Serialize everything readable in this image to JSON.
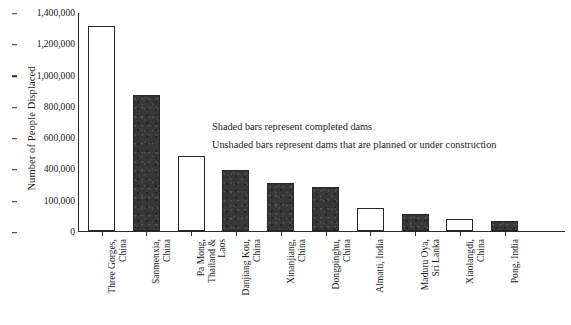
{
  "chart_data": {
    "type": "bar",
    "title": "",
    "xlabel": "",
    "ylabel": "Number of People Displaced",
    "ylim": [
      0,
      1400000
    ],
    "grid": false,
    "legend_position": "none",
    "ytick_labels": [
      "1,400,000",
      "1,200,000",
      "1,000,000",
      "800,000",
      "600,000",
      "400,000",
      "100,000",
      "0"
    ],
    "ytick_values": [
      1400000,
      1200000,
      1000000,
      800000,
      600000,
      400000,
      100000,
      0
    ],
    "categories": [
      "Three Gorges,\nChina",
      "Sanmenxia,\nChina",
      "Pa Mong,\nThailand &\nLaos",
      "Danjiang Kou,\nChina",
      "Xinanjiang,\nChina",
      "Dongpinghu,\nChina",
      "Almatti, India",
      "Maduru Oya,\nSri Lanka",
      "Xiaolangdi,\nChina",
      "Pong, India"
    ],
    "values": [
      1310000,
      870000,
      480000,
      390000,
      310000,
      280000,
      145000,
      110000,
      80000,
      62000
    ],
    "fills": [
      "unshaded",
      "shaded",
      "unshaded",
      "shaded",
      "shaded",
      "shaded",
      "unshaded",
      "shaded",
      "unshaded",
      "shaded"
    ],
    "annotations": [
      "Shaded bars represent completed dams",
      "Unshaded bars represent dams that are planned or under construction"
    ],
    "colors": {
      "shaded_fill": "#373737",
      "unshaded_fill": "#ffffff",
      "bar_border": "#262626",
      "axis": "#2a2a2a",
      "text": "#1a1a1a",
      "background": "#ffffff"
    }
  }
}
